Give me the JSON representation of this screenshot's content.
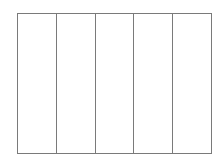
{
  "diagram": {
    "type": "column-grid",
    "columns": [
      {
        "label": ""
      },
      {
        "label": ""
      },
      {
        "label": ""
      },
      {
        "label": ""
      },
      {
        "label": ""
      }
    ],
    "line_color": "#7a7a7a",
    "background": "#ffffff"
  }
}
